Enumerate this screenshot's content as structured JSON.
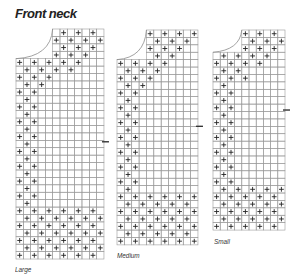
{
  "title": "Front neck",
  "colors": {
    "grid": "#9a9a9a",
    "plus": "#222222",
    "tick": "#333333",
    "curve": "#8a8a8a"
  },
  "charts": [
    {
      "label": "Large",
      "x": 16,
      "y": 29,
      "cols": 12,
      "rows": 31,
      "cw": 7.33,
      "ch": 7.42,
      "notch_col": 5,
      "notch_rows": 4,
      "tick_row": 15.2,
      "label_pos": [
        15,
        265
      ],
      "neck_diag": {
        "start_row": 0,
        "end_row": 6,
        "width": 4
      },
      "side_rows": [
        4,
        24
      ],
      "side_width": 3,
      "bottom_rows": [
        24,
        31
      ]
    },
    {
      "label": "Medium",
      "x": 117,
      "y": 30,
      "cols": 11,
      "rows": 29,
      "cw": 7.36,
      "ch": 7.41,
      "notch_col": 4,
      "notch_rows": 4,
      "tick_row": 13,
      "label_pos": [
        117,
        251
      ],
      "neck_diag": {
        "start_row": 0,
        "end_row": 6,
        "width": 4
      },
      "side_rows": [
        4,
        22
      ],
      "side_width": 3,
      "bottom_rows": [
        22,
        29
      ]
    },
    {
      "label": "Small",
      "x": 213,
      "y": 30,
      "cols": 10,
      "rows": 27,
      "cw": 7.2,
      "ch": 7.41,
      "notch_col": 4,
      "notch_rows": 3,
      "tick_row": 10.8,
      "label_pos": [
        214,
        237
      ],
      "neck_diag": {
        "start_row": 0,
        "end_row": 5,
        "width": 4
      },
      "side_rows": [
        3,
        21
      ],
      "side_width": 3,
      "bottom_rows": [
        21,
        27
      ]
    }
  ]
}
